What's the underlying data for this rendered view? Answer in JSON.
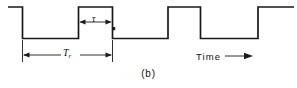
{
  "figure": {
    "caption": "(b)",
    "time_axis_label": "Time",
    "time_arrow_icon": "right-arrow-icon",
    "pulse_width_symbol": "τ",
    "period_symbol": "T",
    "period_subscript": "r",
    "stroke_color": "#1a1a1a",
    "background_color": "#ffffff"
  },
  "chart_data": {
    "type": "line",
    "title": "(b)",
    "xlabel": "Time",
    "ylabel": "",
    "xlim": [
      0,
      297
    ],
    "ylim": [
      0,
      48
    ],
    "grid": false,
    "legend": false,
    "levels": {
      "high": 7,
      "low": 38.5
    },
    "series": [
      {
        "name": "pulse-train",
        "points": [
          [
            8,
            7
          ],
          [
            22.5,
            7
          ],
          [
            22.5,
            38.5
          ],
          [
            78.5,
            38.5
          ],
          [
            78.5,
            7
          ],
          [
            112.5,
            7
          ],
          [
            112.5,
            38.5
          ],
          [
            168,
            38.5
          ],
          [
            168,
            7
          ],
          [
            200.5,
            7
          ],
          [
            200.5,
            38.5
          ],
          [
            258,
            38.5
          ],
          [
            258,
            7
          ],
          [
            294,
            7
          ]
        ]
      }
    ],
    "annotations": [
      {
        "name": "tau-dimension",
        "label": "τ",
        "type": "double-arrow-horizontal",
        "y": 22,
        "x_start": 78.5,
        "x_end": 112.5,
        "meaning": "pulse width"
      },
      {
        "name": "tr-dimension",
        "label": "T_r",
        "type": "double-arrow-horizontal",
        "y": 55,
        "x_start": 22.5,
        "x_end": 112.5,
        "meaning": "pulse repetition period"
      },
      {
        "name": "time-axis-arrow",
        "label": "Time",
        "type": "single-arrow-right",
        "y": 56,
        "x_start": 225,
        "x_end": 252
      }
    ]
  }
}
